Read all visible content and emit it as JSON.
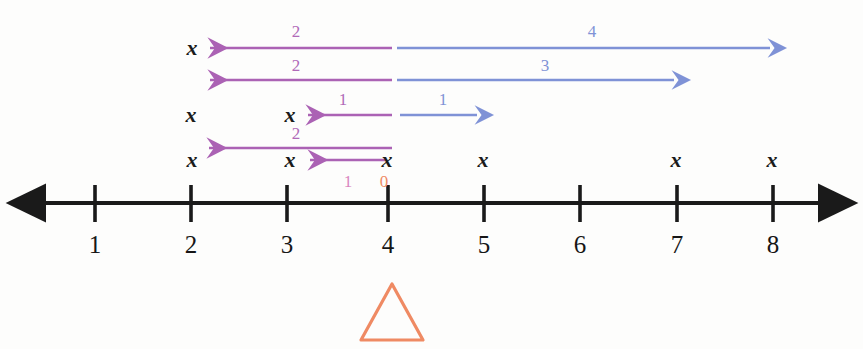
{
  "figure": {
    "colors": {
      "axis": "#1a1a1a",
      "purple": "#ab62b4",
      "blue": "#7f92d6",
      "pink": "#d986c0",
      "orange": "#ef8a63",
      "text": "#161616",
      "background": "#fdfdfc"
    },
    "axis": {
      "name": "number-line",
      "y": 203,
      "x_start": 30,
      "x_end": 833,
      "left_arrowhead": true,
      "right_arrowhead": true,
      "tick_positions_px": [
        95,
        191,
        287,
        388,
        484,
        580,
        677,
        773
      ],
      "tick_labels": [
        "1",
        "2",
        "3",
        "4",
        "5",
        "6",
        "7",
        "8"
      ],
      "tick_label_y": 232,
      "value_min": 1,
      "value_max": 8
    },
    "marker": {
      "name": "orange-triangle",
      "shape": "triangle-outline",
      "at_value": 4,
      "center_x": 392,
      "top_y": 284,
      "base_y": 340,
      "half_width": 31,
      "color": "#ef8a63"
    },
    "rows": [
      {
        "id": "row-1",
        "y": 48,
        "x_marks": [
          {
            "label": "x",
            "x": 192
          }
        ],
        "arrows": [
          {
            "id": "row1-purple-left",
            "color": "purple",
            "direction": "left",
            "from_x": 392,
            "to_x": 205,
            "label": "2",
            "label_x": 296,
            "label_y": 31
          },
          {
            "id": "row1-blue-right",
            "color": "blue",
            "direction": "right",
            "from_x": 397,
            "to_x": 776,
            "label": "4",
            "label_x": 592,
            "label_y": 31
          }
        ]
      },
      {
        "id": "row-2",
        "y": 80,
        "x_marks": [],
        "arrows": [
          {
            "id": "row2-purple-left",
            "color": "purple",
            "direction": "left",
            "from_x": 392,
            "to_x": 205,
            "label": "2",
            "label_x": 296,
            "label_y": 65
          },
          {
            "id": "row2-blue-right",
            "color": "blue",
            "direction": "right",
            "from_x": 397,
            "to_x": 680,
            "label": "3",
            "label_x": 545,
            "label_y": 65
          }
        ]
      },
      {
        "id": "row-3",
        "y": 115,
        "x_marks": [
          {
            "label": "x",
            "x": 191
          },
          {
            "label": "x",
            "x": 290
          }
        ],
        "arrows": [
          {
            "id": "row3-purple-left",
            "color": "purple",
            "direction": "left",
            "from_x": 392,
            "to_x": 303,
            "label": "1",
            "label_x": 343,
            "label_y": 99
          },
          {
            "id": "row3-blue-right",
            "color": "blue",
            "direction": "right",
            "from_x": 400,
            "to_x": 482,
            "label": "1",
            "label_x": 443,
            "label_y": 99
          }
        ]
      },
      {
        "id": "row-4",
        "y": 158,
        "x_marks": [
          {
            "label": "x",
            "x": 192
          },
          {
            "label": "x",
            "x": 290
          },
          {
            "label": "x",
            "x": 387
          },
          {
            "label": "x",
            "x": 483
          },
          {
            "label": "x",
            "x": 676
          },
          {
            "label": "x",
            "x": 772
          }
        ],
        "arrows": [
          {
            "id": "row4-purple-long",
            "color": "purple",
            "direction": "left",
            "y": 148,
            "from_x": 392,
            "to_x": 204,
            "label": "2",
            "label_x": 296,
            "label_y": 133
          },
          {
            "id": "row4-purple-short",
            "color": "purple",
            "direction": "left",
            "y": 160,
            "from_x": 385,
            "to_x": 305,
            "label": "1",
            "label_x": 348,
            "label_y": 181,
            "label_color": "pink"
          }
        ]
      }
    ],
    "extra_labels": [
      {
        "id": "zero-label",
        "text": "0",
        "x": 384,
        "y": 181,
        "color": "orange"
      }
    ]
  }
}
